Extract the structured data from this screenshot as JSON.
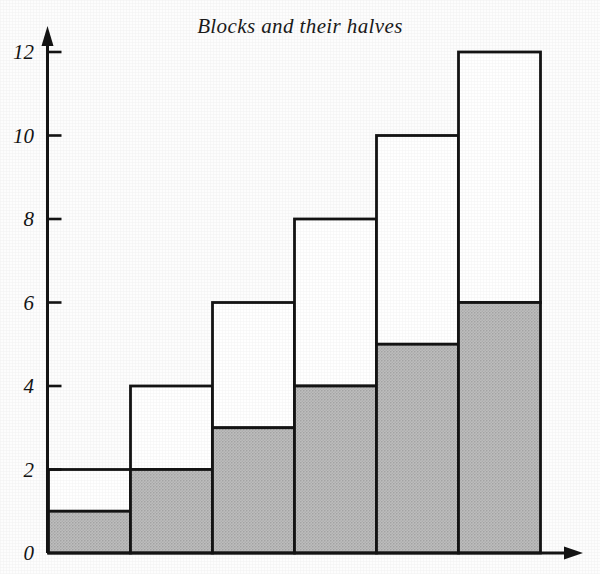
{
  "chart_data": {
    "type": "bar",
    "title": "Blocks and their halves",
    "xlabel": "",
    "ylabel": "",
    "grid": false,
    "legend": false,
    "stacked": true,
    "categories": [
      "1",
      "2",
      "3",
      "4",
      "5",
      "6"
    ],
    "ylim": [
      0,
      12
    ],
    "yticks": [
      0,
      2,
      4,
      6,
      8,
      10,
      12
    ],
    "ytick_labels": [
      "0",
      "2",
      "4",
      "6",
      "8",
      "10",
      "12"
    ],
    "xticks": [],
    "xtick_labels": [],
    "series": [
      {
        "name": "half (shaded)",
        "color": "#b9b9b9",
        "values": [
          1,
          2,
          3,
          4,
          5,
          6
        ]
      },
      {
        "name": "whole block (outline)",
        "color": "#ffffff",
        "values": [
          2,
          4,
          6,
          8,
          10,
          12
        ]
      }
    ],
    "annotations": []
  },
  "axes": {
    "y_arrow": "up-arrow",
    "x_arrow": "right-arrow"
  }
}
